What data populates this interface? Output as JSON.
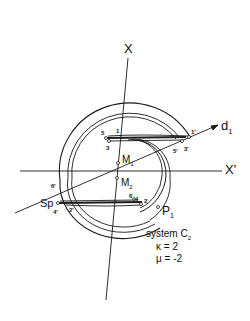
{
  "figure": {
    "axes": {
      "x_label": "X",
      "x_prime_label": "X'",
      "d1_label": "d",
      "d1_sub": "1"
    },
    "centers": {
      "m1_label": "M",
      "m1_sub": "1",
      "m2_label": "M",
      "m2_sub": "2"
    },
    "points": {
      "p1_label": "P",
      "p1_sub": "1",
      "sp_label": "Sp",
      "upper_left": [
        "5",
        "1",
        "3"
      ],
      "upper_right": [
        "1'",
        "5'",
        "3'"
      ],
      "lower_right": [
        "6",
        "4",
        "2"
      ],
      "lower_left": [
        "6'",
        "4'",
        "2'"
      ]
    },
    "caption": {
      "system_label": "system C",
      "system_sub": "2",
      "kappa": "κ = 2",
      "mu": "μ = -2"
    },
    "colors": {
      "line": "#1a1a1a",
      "background": "#ffffff"
    }
  }
}
